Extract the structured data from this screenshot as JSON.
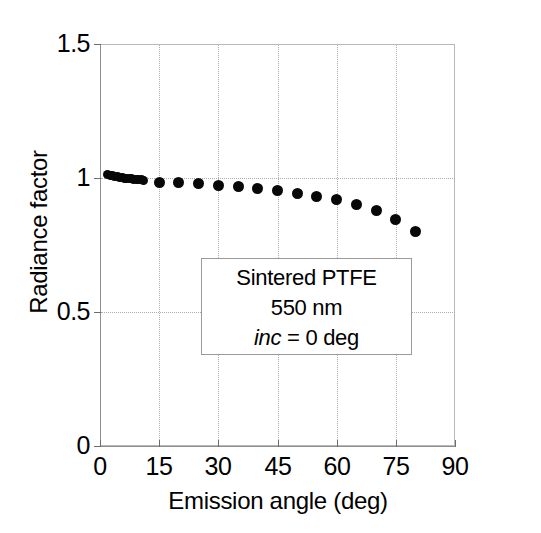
{
  "chart_data": {
    "type": "scatter",
    "title": "",
    "xlabel": "Emission angle (deg)",
    "ylabel": "Radiance factor",
    "xlim": [
      0,
      90
    ],
    "ylim": [
      0,
      1.5
    ],
    "xticks": [
      0,
      15,
      30,
      45,
      60,
      75,
      90
    ],
    "xtick_labels": [
      "0",
      "15",
      "30",
      "45",
      "60",
      "75",
      "90"
    ],
    "yticks": [
      0,
      0.5,
      1,
      1.5
    ],
    "ytick_labels": [
      "0",
      "0.5",
      "1",
      "1.5"
    ],
    "grid": "dotted-both",
    "legend": "none",
    "marker": "filled-circle",
    "marker_color": "#080808",
    "series": [
      {
        "name": "Sintered PTFE 550 nm",
        "x": [
          2,
          2.6,
          3.2,
          3.8,
          4.4,
          5,
          5.6,
          6.2,
          6.8,
          7.4,
          8,
          8.6,
          9.2,
          9.8,
          10.4,
          11,
          15,
          20,
          25,
          30,
          35,
          40,
          45,
          50,
          55,
          60,
          65,
          70,
          75,
          80
        ],
        "y": [
          1.012,
          1.01,
          1.008,
          1.006,
          1.004,
          1.003,
          1.001,
          1.0,
          0.999,
          0.998,
          0.997,
          0.996,
          0.995,
          0.994,
          0.993,
          0.992,
          0.985,
          0.982,
          0.978,
          0.972,
          0.967,
          0.96,
          0.952,
          0.943,
          0.93,
          0.92,
          0.9,
          0.877,
          0.845,
          0.8
        ]
      }
    ],
    "annotation": {
      "line1": "Sintered PTFE",
      "line2": "550 nm",
      "line3_italic": "inc",
      "line3_rest": " = 0 deg"
    }
  }
}
